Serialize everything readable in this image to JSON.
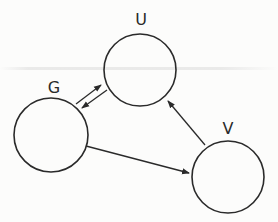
{
  "diagram": {
    "type": "directed-graph",
    "nodes": [
      {
        "id": "U",
        "label": "U",
        "cx": 140,
        "cy": 70,
        "r": 36,
        "label_x": 141,
        "label_y": 25
      },
      {
        "id": "G",
        "label": "G",
        "cx": 51,
        "cy": 135,
        "r": 37,
        "label_x": 54,
        "label_y": 93
      },
      {
        "id": "V",
        "label": "V",
        "cx": 228,
        "cy": 177,
        "r": 36,
        "label_x": 228,
        "label_y": 134
      }
    ],
    "edges": [
      {
        "from": "G",
        "to": "U",
        "x1": 76,
        "y1": 104,
        "x2": 101,
        "y2": 85
      },
      {
        "from": "U",
        "to": "G",
        "x1": 107,
        "y1": 90,
        "x2": 82,
        "y2": 108
      },
      {
        "from": "V",
        "to": "U",
        "x1": 205,
        "y1": 145,
        "x2": 168,
        "y2": 101
      },
      {
        "from": "G",
        "to": "V",
        "x1": 86,
        "y1": 146,
        "x2": 189,
        "y2": 173
      }
    ],
    "colors": {
      "stroke": "#2a2a2a",
      "background": "#fcfcfb"
    }
  }
}
